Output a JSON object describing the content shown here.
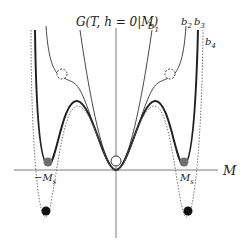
{
  "diagram": {
    "title_label": "G(T, h = 0|M)",
    "x_axis_label": "M",
    "neg_ms_label": "−M",
    "neg_ms_sub": "s",
    "pos_ms_label": "M",
    "pos_ms_sub": "s",
    "curves": [
      {
        "id": "b1",
        "label": "b",
        "sub": "1",
        "style": "thin solid",
        "description": "single-well parabola, minimum at origin"
      },
      {
        "id": "b2",
        "label": "b",
        "sub": "2",
        "style": "thin solid",
        "description": "minimum at origin with inflection shoulders (metastable points)"
      },
      {
        "id": "b3",
        "label": "b",
        "sub": "3",
        "style": "thick solid",
        "description": "three degenerate minima at −Ms, 0, Ms"
      },
      {
        "id": "b4",
        "label": "b",
        "sub": "4",
        "style": "dotted",
        "description": "side minima below zero, origin metastable"
      }
    ],
    "markers": [
      {
        "id": "origin-open-circle",
        "type": "open circle",
        "position": "M=0"
      },
      {
        "id": "shoulder-left",
        "type": "dashed circle",
        "curve": "b2"
      },
      {
        "id": "shoulder-right",
        "type": "dashed circle",
        "curve": "b2"
      },
      {
        "id": "gray-left",
        "type": "gray filled circle",
        "curve": "b3",
        "position": "−Ms"
      },
      {
        "id": "gray-right",
        "type": "gray filled circle",
        "curve": "b3",
        "position": "Ms"
      },
      {
        "id": "black-left",
        "type": "black filled circle",
        "curve": "b4"
      },
      {
        "id": "black-right",
        "type": "black filled circle",
        "curve": "b4"
      }
    ],
    "colors": {
      "axis": "#7a7a7a",
      "curve": "#333333",
      "gray_dot": "#6e6e6e",
      "black_dot": "#111111"
    }
  }
}
